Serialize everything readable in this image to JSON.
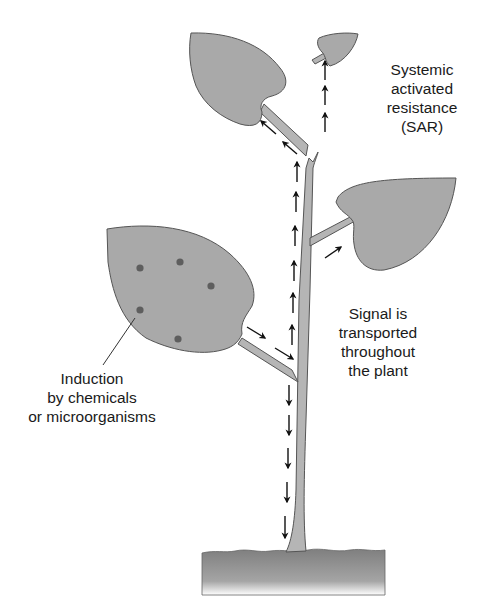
{
  "diagram": {
    "colors": {
      "leaf_fill": "#a9a9a9",
      "leaf_stroke": "#555555",
      "stem_fill": "#b5b5b5",
      "soil_fill": "#8f8f8f",
      "spot": "#5e5e5e",
      "arrow": "#111111",
      "text": "#1a1a1a"
    },
    "labels": {
      "sar": "Systemic\nactivated\nresistance\n(SAR)",
      "signal": "Signal is\ntransported\nthroughout\nthe plant",
      "induction": "Induction\nby chemicals\nor microorganisms"
    },
    "elements": {
      "leaves": [
        "upper-left-leaf",
        "top-small-leaf",
        "right-leaf",
        "infected-lower-left-leaf"
      ],
      "infection_spots": 5,
      "arrows": {
        "up_main_stem": 6,
        "up_top_branch": 3,
        "to_upper_left_leaf": 2,
        "to_right_leaf": 1,
        "from_infected_leaf": 2,
        "down_to_roots": 5
      }
    }
  }
}
